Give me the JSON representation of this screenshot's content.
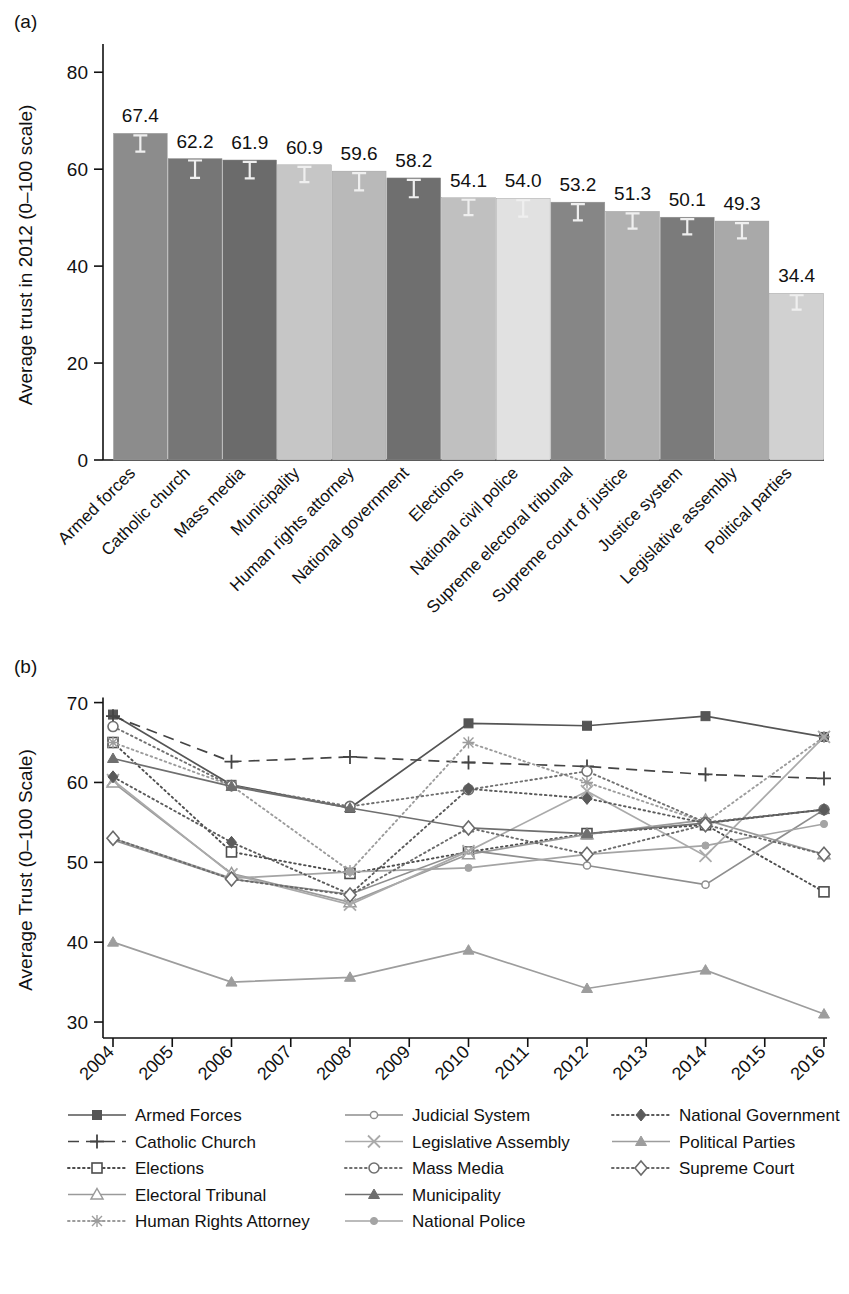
{
  "figure": {
    "panel_a_letter": "(a)",
    "panel_b_letter": "(b)"
  },
  "chart_data": [
    {
      "type": "bar",
      "panel": "(a)",
      "title": "",
      "xlabel": "",
      "ylabel": "Average trust in 2012 (0–100 scale)",
      "ylim": [
        0,
        85
      ],
      "yticks": [
        0,
        20,
        40,
        60,
        80
      ],
      "grid": false,
      "categories": [
        "Armed forces",
        "Catholic church",
        "Mass media",
        "Municipality",
        "Human rights attorney",
        "National government",
        "Elections",
        "National civil police",
        "Supreme electoral tribunal",
        "Supreme court of justice",
        "Justice system",
        "Legislative assembly",
        "Political parties"
      ],
      "values": [
        67.4,
        62.2,
        61.9,
        60.9,
        59.6,
        58.2,
        54.1,
        54.0,
        53.2,
        51.3,
        50.1,
        49.3,
        34.4
      ],
      "value_labels": [
        "67.4",
        "62.2",
        "61.9",
        "60.9",
        "59.6",
        "58.2",
        "54.1",
        "54.0",
        "53.2",
        "51.3",
        "50.1",
        "49.3",
        "34.4"
      ],
      "errors": [
        1.6,
        1.7,
        1.6,
        1.5,
        1.7,
        1.7,
        1.5,
        1.6,
        1.6,
        1.5,
        1.5,
        1.5,
        1.4
      ],
      "bar_colors": [
        "#8c8c8c",
        "#767676",
        "#6b6b6b",
        "#c6c6c6",
        "#b9b9b9",
        "#6f6f6f",
        "#c0c0c0",
        "#e1e1e1",
        "#868686",
        "#b1b1b1",
        "#7b7b7b",
        "#a9a9a9",
        "#d1d1d1"
      ]
    },
    {
      "type": "line",
      "panel": "(b)",
      "title": "",
      "xlabel": "",
      "ylabel": "Average Trust (0–100 Scale)",
      "ylim": [
        28,
        71
      ],
      "yticks": [
        30,
        40,
        50,
        60,
        70
      ],
      "grid": false,
      "legend_position": "bottom",
      "x": [
        2004,
        2006,
        2008,
        2010,
        2012,
        2014,
        2016
      ],
      "xticks": [
        "2004",
        "2005",
        "2006",
        "2007",
        "2008",
        "2009",
        "2010",
        "2011",
        "2012",
        "2013",
        "2014",
        "2015",
        "2016"
      ],
      "series": [
        {
          "name": "Armed Forces",
          "marker": "filled-square",
          "line": "solid",
          "color": "#555555",
          "values": [
            68.5,
            59.7,
            56.8,
            67.4,
            67.1,
            68.3,
            65.7
          ]
        },
        {
          "name": "Catholic Church",
          "marker": "plus",
          "line": "dashed",
          "color": "#444444",
          "values": [
            68.3,
            62.6,
            63.2,
            62.5,
            62.0,
            61.0,
            60.5
          ]
        },
        {
          "name": "Elections",
          "marker": "open-square",
          "line": "dotted",
          "color": "#4d4d4d",
          "values": [
            65.0,
            51.3,
            48.6,
            51.3,
            53.6,
            54.7,
            46.3
          ]
        },
        {
          "name": "Electoral Tribunal",
          "marker": "open-triangle",
          "line": "solid",
          "color": "#9a9a9a",
          "values": [
            60.0,
            48.6,
            45.0,
            51.0,
            53.5,
            55.3,
            51.0
          ]
        },
        {
          "name": "Human Rights Attorney",
          "marker": "star",
          "line": "dotted",
          "color": "#9c9c9c",
          "values": [
            65.0,
            59.6,
            48.9,
            65.0,
            60.0,
            55.0,
            65.7
          ]
        },
        {
          "name": "Judicial System",
          "marker": "small-circle",
          "line": "solid",
          "color": "#8e8e8e",
          "values": [
            52.8,
            47.9,
            46.0,
            51.5,
            49.6,
            47.2,
            56.6
          ]
        },
        {
          "name": "Legislative Assembly",
          "marker": "x",
          "line": "solid",
          "color": "#aaaaaa",
          "values": [
            60.3,
            48.5,
            44.7,
            51.4,
            58.9,
            50.8,
            65.7
          ]
        },
        {
          "name": "Mass Media",
          "marker": "open-circle",
          "line": "dotted",
          "color": "#707070",
          "values": [
            67.0,
            59.6,
            57.0,
            59.1,
            61.4,
            55.0,
            56.6
          ]
        },
        {
          "name": "Municipality",
          "marker": "filled-triangle",
          "line": "solid",
          "color": "#6f6f6f",
          "values": [
            63.0,
            59.5,
            56.8,
            54.3,
            53.6,
            54.9,
            56.6
          ]
        },
        {
          "name": "National Police",
          "marker": "small-dot",
          "line": "solid",
          "color": "#a4a4a4",
          "values": [
            53.0,
            48.0,
            48.8,
            49.3,
            51.0,
            52.1,
            54.8
          ]
        },
        {
          "name": "National Government",
          "marker": "filled-diamond",
          "line": "dotted",
          "color": "#5a5a5a",
          "values": [
            60.7,
            52.5,
            46.0,
            59.2,
            58.0,
            54.9,
            56.6
          ]
        },
        {
          "name": "Political Parties",
          "marker": "filled-triangle",
          "line": "solid",
          "color": "#9d9d9d",
          "values": [
            40.0,
            35.0,
            35.6,
            39.0,
            34.2,
            36.5,
            31.0
          ]
        },
        {
          "name": "Supreme Court",
          "marker": "open-diamond",
          "line": "dotted",
          "color": "#6a6a6a",
          "values": [
            53.0,
            47.9,
            45.9,
            54.3,
            51.0,
            54.7,
            51.0
          ]
        }
      ]
    }
  ],
  "legend": {
    "column1": [
      "Armed Forces",
      "Catholic Church",
      "Elections",
      "Electoral Tribunal",
      "Human Rights Attorney"
    ],
    "column2": [
      "Judicial System",
      "Legislative Assembly",
      "Mass Media",
      "Municipality",
      "National Police"
    ],
    "column3": [
      "National Government",
      "Political Parties",
      "Supreme Court"
    ]
  }
}
